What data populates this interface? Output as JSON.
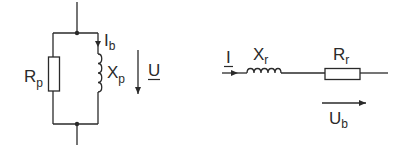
{
  "diagram": {
    "type": "equivalent-circuits",
    "stroke_color": "#2a2a2a",
    "background": "#ffffff",
    "left_circuit": {
      "topology": "parallel",
      "resistor": {
        "symbol": "R",
        "subscript": "p"
      },
      "inductor": {
        "symbol": "X",
        "subscript": "p"
      },
      "current": {
        "symbol": "I",
        "subscript": "b"
      },
      "voltage": {
        "symbol": "U",
        "underlined": true
      }
    },
    "right_circuit": {
      "topology": "series",
      "current": {
        "symbol": "I",
        "underlined": true
      },
      "inductor": {
        "symbol": "X",
        "subscript": "r"
      },
      "resistor": {
        "symbol": "R",
        "subscript": "r"
      },
      "voltage": {
        "symbol": "U",
        "subscript": "b"
      }
    }
  }
}
